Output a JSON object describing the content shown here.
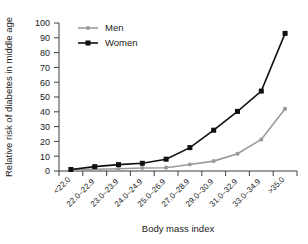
{
  "chart_data": {
    "type": "line",
    "title": "",
    "xlabel": "Body mass index",
    "ylabel": "Relative risk of diabetes in middle age",
    "categories": [
      "<22.0",
      "22.0–22.9",
      "23.0–23.9",
      "24.0–24.9",
      "25.0–26.9",
      "27.0–28.9",
      "29.0–30.9",
      "31.0–32.9",
      "33.0–34.9",
      ">35.0"
    ],
    "series": [
      {
        "name": "Men",
        "color": "#9a9a9a",
        "marker": "circle",
        "values": [
          1,
          1.2,
          1.5,
          2,
          2.2,
          4.4,
          6.7,
          11.6,
          21.3,
          42
        ]
      },
      {
        "name": "Women",
        "color": "#101010",
        "marker": "square",
        "values": [
          1,
          3,
          4.3,
          5.2,
          8,
          15.8,
          27.6,
          40.3,
          54,
          93
        ]
      }
    ],
    "ylim": [
      0,
      100
    ],
    "yticks": [
      0,
      10,
      20,
      30,
      40,
      50,
      60,
      70,
      80,
      90,
      100
    ],
    "ytick_labels": [
      "0",
      "10",
      "20",
      "30",
      "40",
      "50",
      "60",
      "70",
      "80",
      "90",
      "100"
    ],
    "grid": false,
    "legend_position": "top-left"
  },
  "legend": {
    "items": [
      {
        "label": "Men"
      },
      {
        "label": "Women"
      }
    ]
  },
  "axes": {
    "x_title": "Body mass index",
    "y_title": "Relative risk of diabetes in middle age"
  }
}
